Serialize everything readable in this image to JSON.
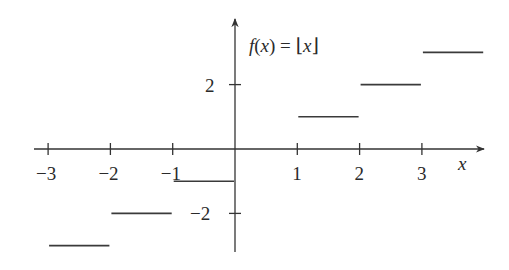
{
  "chart_data": {
    "type": "line",
    "subtype": "step-function",
    "title": "f(x) = ⌊x⌋",
    "xlabel": "x",
    "ylabel": "",
    "xlim": [
      -3.5,
      4.0
    ],
    "ylim": [
      -3.5,
      3.8
    ],
    "grid": false,
    "legend": null,
    "x_ticks": [
      -3,
      -2,
      -1,
      1,
      2,
      3
    ],
    "x_tick_labels": [
      "−3",
      "−2",
      "−1",
      "1",
      "2",
      "3"
    ],
    "y_ticks": [
      2,
      -2
    ],
    "y_tick_labels": [
      "2",
      "−2"
    ],
    "segments": [
      {
        "x_start": -3,
        "x_end": -2,
        "y": -3
      },
      {
        "x_start": -2,
        "x_end": -1,
        "y": -2
      },
      {
        "x_start": -1,
        "x_end": 0,
        "y": -1
      },
      {
        "x_start": 1,
        "x_end": 2,
        "y": 1
      },
      {
        "x_start": 2,
        "x_end": 3,
        "y": 2
      },
      {
        "x_start": 3,
        "x_end": 4,
        "y": 3
      }
    ]
  },
  "labels": {
    "title_f": "f",
    "title_rest": "(",
    "title_x": "x",
    "title_close": ") = ⌊",
    "title_x2": "x",
    "title_end": "⌋",
    "x_axis": "x"
  }
}
